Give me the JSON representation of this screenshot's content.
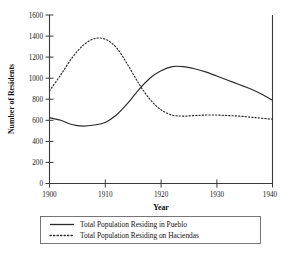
{
  "chart_data": {
    "type": "line",
    "title": "",
    "xlabel": "Year",
    "ylabel": "Number of Residents",
    "xlim": [
      1900,
      1940
    ],
    "ylim": [
      0,
      1600
    ],
    "xticks": [
      1900,
      1910,
      1920,
      1930,
      1940
    ],
    "yticks": [
      0,
      200,
      400,
      600,
      800,
      1000,
      1200,
      1400,
      1600
    ],
    "grid": false,
    "legend_position": "below-axes",
    "series": [
      {
        "name": "Total Population Residing in Pueblo",
        "style": "solid",
        "color": "#2b2b2b",
        "x": [
          1900,
          1902,
          1904,
          1906,
          1908,
          1910,
          1912,
          1914,
          1916,
          1918,
          1920,
          1922,
          1924,
          1926,
          1928,
          1930,
          1932,
          1934,
          1936,
          1938,
          1940
        ],
        "values": [
          625,
          600,
          560,
          545,
          555,
          580,
          650,
          760,
          890,
          1000,
          1070,
          1110,
          1110,
          1090,
          1060,
          1020,
          980,
          940,
          900,
          850,
          790
        ]
      },
      {
        "name": "Total Population Residing on Haciendas",
        "style": "dotted",
        "color": "#2b2b2b",
        "x": [
          1900,
          1902,
          1904,
          1906,
          1908,
          1910,
          1912,
          1914,
          1916,
          1918,
          1920,
          1922,
          1924,
          1926,
          1928,
          1930,
          1932,
          1934,
          1936,
          1938,
          1940
        ],
        "values": [
          880,
          1030,
          1190,
          1310,
          1375,
          1370,
          1290,
          1130,
          950,
          800,
          700,
          650,
          640,
          645,
          650,
          650,
          645,
          640,
          630,
          620,
          610
        ]
      }
    ]
  },
  "axes": {
    "ylabel": "Number of Residents",
    "xlabel": "Year"
  },
  "legend": {
    "entries": [
      {
        "label": "Total Population Residing in Pueblo",
        "marker": "solid-line-sample"
      },
      {
        "label": "Total Population Residing on Haciendas",
        "marker": "dotted-line-sample"
      }
    ]
  }
}
